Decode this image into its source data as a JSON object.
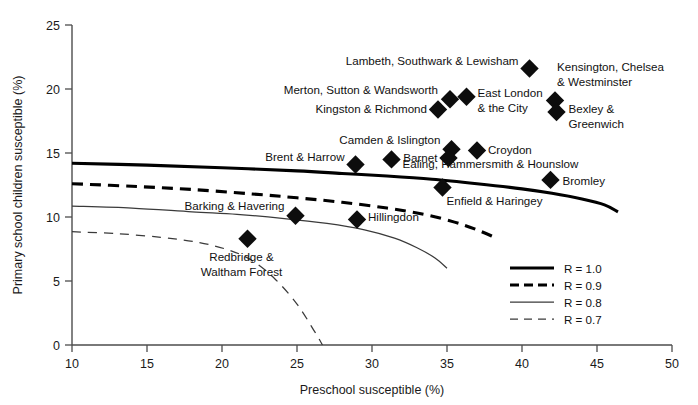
{
  "chart_data": {
    "type": "scatter",
    "title": "",
    "xlabel": "Preschool susceptible (%)",
    "ylabel": "Primary school children susceptible (%)",
    "xlim": [
      10,
      50
    ],
    "ylim": [
      0,
      25
    ],
    "xticks": [
      10,
      15,
      20,
      25,
      30,
      35,
      40,
      45,
      50
    ],
    "yticks": [
      0,
      5,
      10,
      15,
      20,
      25
    ],
    "grid": false,
    "legend_position": "lower-right",
    "points": [
      {
        "label": "Lambeth, Southwark & Lewisham",
        "x": 40.5,
        "y": 21.6,
        "label_anchor": "end",
        "label_dx": -11,
        "label_dy": -4
      },
      {
        "label": "Kensington, Chelsea\n& Westminster",
        "x": 42.2,
        "y": 19.1,
        "label_anchor": "start",
        "label_dx": 2,
        "label_dy": -30
      },
      {
        "label": "Merton, Sutton & Wandsworth",
        "x": 35.2,
        "y": 19.2,
        "label_anchor": "end",
        "label_dx": -12,
        "label_dy": -5
      },
      {
        "label": "East London\n& the City",
        "x": 36.3,
        "y": 19.4,
        "label_anchor": "start",
        "label_dx": 11,
        "label_dy": 0
      },
      {
        "label": "Kingston & Richmond",
        "x": 34.4,
        "y": 18.4,
        "label_anchor": "end",
        "label_dx": -11,
        "label_dy": 4
      },
      {
        "label": "Bexley &\nGreenwich",
        "x": 42.3,
        "y": 18.2,
        "label_anchor": "start",
        "label_dx": 12,
        "label_dy": 1
      },
      {
        "label": "Camden & Islington",
        "x": 35.3,
        "y": 15.3,
        "label_anchor": "end",
        "label_dx": -11,
        "label_dy": -5
      },
      {
        "label": "Croydon",
        "x": 37.0,
        "y": 15.2,
        "label_anchor": "start",
        "label_dx": 11,
        "label_dy": 4
      },
      {
        "label": "Barnet",
        "x": 35.1,
        "y": 14.6,
        "label_anchor": "end",
        "label_dx": -11,
        "label_dy": 4
      },
      {
        "label": "Ealing, Hammersmith & Hounslow",
        "x": 31.3,
        "y": 14.5,
        "label_anchor": "start",
        "label_dx": 11,
        "label_dy": 9
      },
      {
        "label": "Brent & Harrow",
        "x": 28.9,
        "y": 14.1,
        "label_anchor": "end",
        "label_dx": -11,
        "label_dy": -4
      },
      {
        "label": "Bromley",
        "x": 41.9,
        "y": 12.9,
        "label_anchor": "start",
        "label_dx": 12,
        "label_dy": 5
      },
      {
        "label": "Enfield & Haringey",
        "x": 34.7,
        "y": 12.3,
        "label_anchor": "start",
        "label_dx": 4,
        "label_dy": 17
      },
      {
        "label": "Barking & Havering",
        "x": 24.9,
        "y": 10.1,
        "label_anchor": "end",
        "label_dx": -11,
        "label_dy": -6
      },
      {
        "label": "Hillingdon",
        "x": 29.0,
        "y": 9.8,
        "label_anchor": "start",
        "label_dx": 11,
        "label_dy": 1
      },
      {
        "label": "Redbridge &\nWaltham Forest",
        "x": 21.7,
        "y": 8.3,
        "label_anchor": "middle",
        "label_dx": -6,
        "label_dy": 22
      }
    ],
    "curves": [
      {
        "name": "R = 1.0",
        "style": "thick-solid",
        "points": [
          [
            10,
            14.2
          ],
          [
            15,
            14.05
          ],
          [
            20,
            13.85
          ],
          [
            25,
            13.6
          ],
          [
            28,
            13.4
          ],
          [
            31,
            13.2
          ],
          [
            34,
            12.95
          ],
          [
            37,
            12.6
          ],
          [
            40,
            12.2
          ],
          [
            42,
            11.85
          ],
          [
            44,
            11.4
          ],
          [
            45.5,
            10.95
          ],
          [
            46.4,
            10.4
          ]
        ]
      },
      {
        "name": "R = 0.9",
        "style": "thick-dashed",
        "points": [
          [
            10,
            12.6
          ],
          [
            14,
            12.4
          ],
          [
            18,
            12.15
          ],
          [
            22,
            11.8
          ],
          [
            25,
            11.5
          ],
          [
            28,
            11.15
          ],
          [
            31,
            10.7
          ],
          [
            33.5,
            10.2
          ],
          [
            35.5,
            9.6
          ],
          [
            37,
            9.0
          ],
          [
            38.2,
            8.4
          ]
        ]
      },
      {
        "name": "R = 0.8",
        "style": "thin-solid",
        "points": [
          [
            10,
            10.85
          ],
          [
            14,
            10.7
          ],
          [
            18,
            10.4
          ],
          [
            21,
            10.2
          ],
          [
            24,
            9.9
          ],
          [
            27,
            9.5
          ],
          [
            29.5,
            9.0
          ],
          [
            31.5,
            8.35
          ],
          [
            33,
            7.6
          ],
          [
            34.2,
            6.8
          ],
          [
            35,
            6.0
          ]
        ]
      },
      {
        "name": "R = 0.7",
        "style": "thin-dashed",
        "points": [
          [
            10,
            8.85
          ],
          [
            13,
            8.7
          ],
          [
            16,
            8.4
          ],
          [
            18.5,
            8.0
          ],
          [
            20.5,
            7.4
          ],
          [
            22,
            6.6
          ],
          [
            23.5,
            5.2
          ],
          [
            25,
            3.2
          ],
          [
            26.2,
            1.0
          ],
          [
            26.7,
            0.0
          ]
        ]
      }
    ],
    "legend": [
      {
        "label": "R = 1.0",
        "style": "thick-solid"
      },
      {
        "label": "R = 0.9",
        "style": "thick-dashed"
      },
      {
        "label": "R = 0.8",
        "style": "thin-solid"
      },
      {
        "label": "R = 0.7",
        "style": "thin-dashed"
      }
    ],
    "colors": {
      "marker": "#0d0d0d",
      "axis": "#4d4d4d",
      "text": "#111111",
      "curve_thick": "#000000",
      "curve_thin": "#3a3a3a"
    }
  }
}
